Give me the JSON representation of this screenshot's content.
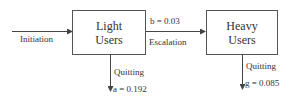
{
  "diagram": {
    "nodes": [
      {
        "id": "light",
        "line1": "Light",
        "line2": "Users"
      },
      {
        "id": "heavy",
        "line1": "Heavy",
        "line2": "Users"
      }
    ],
    "edges": {
      "initiation": {
        "label": "Initiation"
      },
      "escalation": {
        "label": "Escalation",
        "rate": "b = 0.03"
      },
      "quit_light": {
        "label": "Quitting",
        "rate": "a = 0.192"
      },
      "quit_heavy": {
        "label": "Quitting",
        "rate": "g = 0.085"
      }
    },
    "colors": {
      "line": "#444444",
      "text": "#333333"
    }
  }
}
